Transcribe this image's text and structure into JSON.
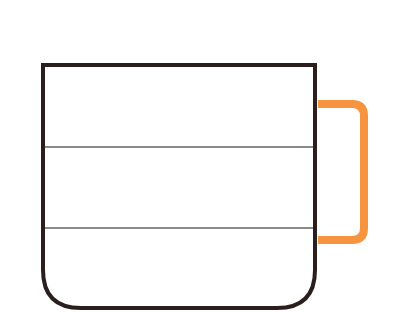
{
  "diagram": {
    "type": "mug-fill-levels",
    "colors": {
      "background": "#ffffff",
      "mug_outline": "#2a1f1d",
      "handle": "#f7943f",
      "level_lines": "#8a8a8a",
      "mug_fill": "#ffffff"
    },
    "mug": {
      "left": 42,
      "right": 316,
      "top": 63,
      "bottom": 310,
      "corner_radius": 40,
      "stroke_width": 4
    },
    "handle": {
      "x_start": 318,
      "x_end": 368,
      "y_top": 104,
      "y_bottom": 240,
      "corner_radius": 12,
      "stroke_width": 8
    },
    "level_lines": [
      {
        "y": 147
      },
      {
        "y": 228
      }
    ],
    "sections": 3
  }
}
